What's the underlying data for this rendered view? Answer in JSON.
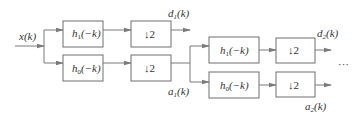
{
  "diagram": {
    "input": {
      "label": "x(k)"
    },
    "stages": [
      {
        "highpass": {
          "name": "h",
          "sub": "1",
          "arg": "(−k)"
        },
        "lowpass": {
          "name": "h",
          "sub": "0",
          "arg": "(−k)"
        },
        "downsample": "↓2",
        "detail_out": {
          "name": "d",
          "sub": "1",
          "arg": "(k)"
        },
        "approx_out": {
          "name": "a",
          "sub": "1",
          "arg": "(k)"
        }
      },
      {
        "highpass": {
          "name": "h",
          "sub": "1",
          "arg": "(−k)"
        },
        "lowpass": {
          "name": "h",
          "sub": "0",
          "arg": "(−k)"
        },
        "downsample": "↓2",
        "detail_out": {
          "name": "d",
          "sub": "2",
          "arg": "(k)"
        },
        "approx_out": {
          "name": "a",
          "sub": "2",
          "arg": "(k)"
        }
      }
    ],
    "continuation": "···"
  }
}
